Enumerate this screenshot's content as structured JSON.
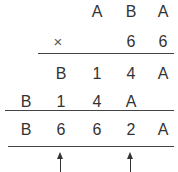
{
  "multiplication": {
    "multiplicand": [
      "A",
      "B",
      "A"
    ],
    "operator": "×",
    "multiplier": [
      "6",
      "6"
    ],
    "partial_1": [
      "B",
      "1",
      "4",
      "A"
    ],
    "partial_2": [
      "B",
      "1",
      "4",
      "A"
    ],
    "result": [
      "B",
      "6",
      "6",
      "2",
      "A"
    ]
  },
  "arrows": [
    "column-2",
    "column-4"
  ]
}
